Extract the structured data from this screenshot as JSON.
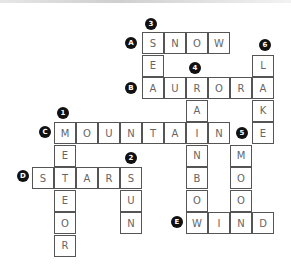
{
  "puzzle": {
    "type": "crossword",
    "grid": {
      "origin_x": 32,
      "origin_y": 32,
      "cell_w": 22,
      "cell_h": 22.5
    },
    "words": [
      {
        "id": "A",
        "direction": "across",
        "answer": "SNOW",
        "row": 0,
        "col": 5
      },
      {
        "id": "B",
        "direction": "across",
        "answer": "AURORA",
        "row": 2,
        "col": 5
      },
      {
        "id": "C",
        "direction": "across",
        "answer": "MOUNTAIN",
        "row": 4,
        "col": 1
      },
      {
        "id": "D",
        "direction": "across",
        "answer": "STARS",
        "row": 6,
        "col": 0
      },
      {
        "id": "E",
        "direction": "across",
        "answer": "WIND",
        "row": 8,
        "col": 7
      },
      {
        "id": "1",
        "direction": "down",
        "answer": "METEOR",
        "row": 4,
        "col": 1
      },
      {
        "id": "2",
        "direction": "down",
        "answer": "SUN",
        "row": 6,
        "col": 4
      },
      {
        "id": "3",
        "direction": "down",
        "answer": "SEA",
        "row": 0,
        "col": 5
      },
      {
        "id": "4",
        "direction": "down",
        "answer": "RAINBOW",
        "row": 2,
        "col": 7
      },
      {
        "id": "5",
        "direction": "down",
        "answer": "MOON",
        "row": 5,
        "col": 9
      },
      {
        "id": "6",
        "direction": "down",
        "answer": "LAKE",
        "row": 1,
        "col": 10
      }
    ],
    "badges": [
      {
        "label": "A",
        "x": 125,
        "y": 37
      },
      {
        "label": "B",
        "x": 125,
        "y": 82
      },
      {
        "label": "C",
        "x": 39,
        "y": 126
      },
      {
        "label": "D",
        "x": 17,
        "y": 170
      },
      {
        "label": "E",
        "x": 171,
        "y": 216
      },
      {
        "label": "1",
        "x": 57,
        "y": 107
      },
      {
        "label": "2",
        "x": 125,
        "y": 152
      },
      {
        "label": "3",
        "x": 145,
        "y": 18
      },
      {
        "label": "4",
        "x": 189,
        "y": 62
      },
      {
        "label": "5",
        "x": 236,
        "y": 127
      },
      {
        "label": "6",
        "x": 259,
        "y": 39
      }
    ]
  }
}
